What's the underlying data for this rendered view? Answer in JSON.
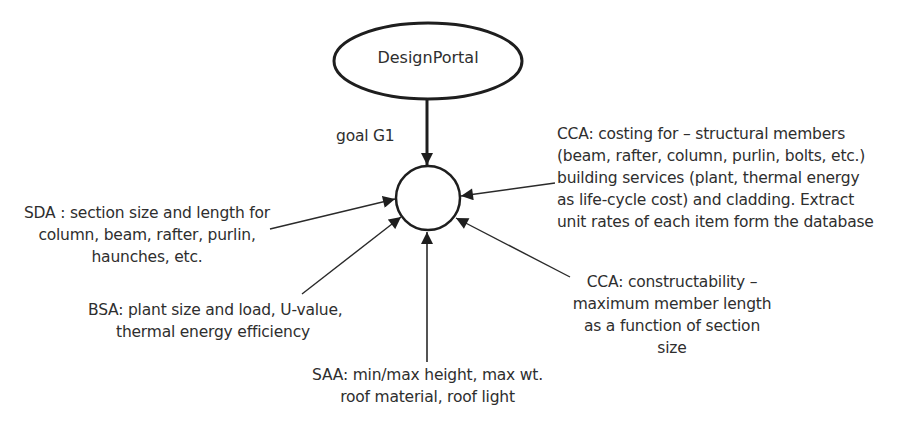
{
  "root_node": {
    "label": "DesignPortal"
  },
  "goal_edge": {
    "label": "goal G1"
  },
  "hub_node": {
    "label": ""
  },
  "inputs": [
    {
      "id": "sda",
      "lines": [
        "SDA : section size and length for",
        "column, beam, rafter, purlin,",
        "haunches, etc."
      ]
    },
    {
      "id": "bsa",
      "lines": [
        "BSA: plant size and load, U-value,",
        "thermal energy efficiency"
      ]
    },
    {
      "id": "saa",
      "lines": [
        "SAA: min/max height, max wt.",
        "roof material, roof light"
      ]
    },
    {
      "id": "cca-constructability",
      "lines": [
        "CCA: constructability –",
        "maximum member length",
        "as a function of section",
        "size"
      ]
    },
    {
      "id": "cca-costing",
      "lines": [
        "CCA: costing for – structural members",
        "(beam, rafter, column, purlin, bolts, etc.)",
        "building services (plant, thermal energy",
        "as life-cycle cost) and cladding. Extract",
        "unit rates of each item form the database"
      ]
    }
  ],
  "colors": {
    "stroke": "#1e1e1e",
    "text": "#2e2e2e",
    "background": "#ffffff"
  }
}
